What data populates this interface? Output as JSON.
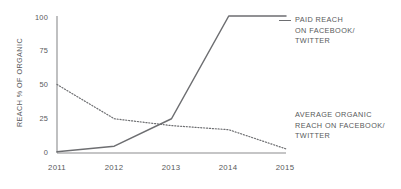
{
  "chart_data": {
    "type": "line",
    "title": "",
    "xlabel": "",
    "ylabel": "REACH % OF ORGANIC",
    "x": [
      "2011",
      "2012",
      "2013",
      "2014",
      "2015"
    ],
    "xlim": [
      2011,
      2015
    ],
    "ylim": [
      0,
      100
    ],
    "yticks": [
      0,
      25,
      50,
      75,
      100
    ],
    "ytick_labels": [
      "0",
      "25",
      "50",
      "75",
      "100"
    ],
    "xtick_labels": [
      "2011",
      "2012",
      "2013",
      "2014",
      "2015"
    ],
    "grid": false,
    "legend_position": "right",
    "series": [
      {
        "name": "PAID REACH ON FACEBOOK/ TWITTER",
        "style": "solid",
        "color": "#6d6e71",
        "values": [
          1,
          5,
          25,
          100,
          100
        ]
      },
      {
        "name": "AVERAGE ORGANIC REACH ON FACEBOOK/ TWITTER",
        "style": "dotted",
        "color": "#6d6e71",
        "values": [
          50,
          25,
          20,
          17,
          3
        ]
      }
    ]
  },
  "axes": {
    "y_title": "REACH % OF ORGANIC",
    "y_ticks": [
      "100",
      "75",
      "50",
      "25",
      "0"
    ],
    "x_ticks": [
      "2011",
      "2012",
      "2013",
      "2014",
      "2015"
    ]
  },
  "legend": {
    "paid": {
      "line1": "PAID REACH",
      "line2": "ON FACEBOOK/",
      "line3": "TWITTER"
    },
    "organic": {
      "line1": "AVERAGE ORGANIC",
      "line2": "REACH ON FACEBOOK/",
      "line3": "TWITTER"
    }
  },
  "colors": {
    "line": "#6d6e71",
    "text": "#58595b",
    "axis": "#8b8c8e"
  }
}
